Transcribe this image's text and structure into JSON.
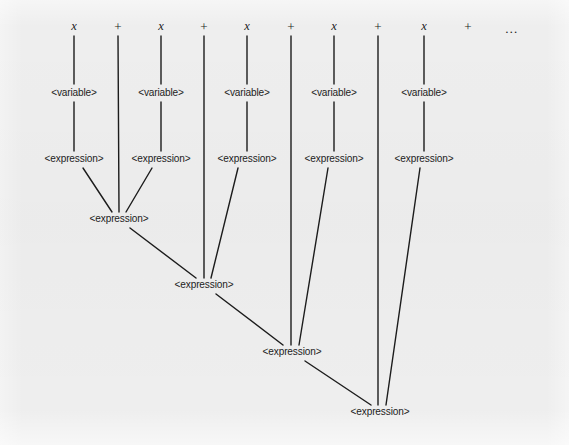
{
  "figure": {
    "kind": "parse-tree-diagram",
    "title": "",
    "canvas": {
      "width": 569,
      "height": 445
    },
    "background_color": "#eeeeee",
    "ink_color": "#1c1c1c",
    "line_width": 1.4
  },
  "labels": {
    "variable": "<variable>",
    "expression": "<expression>",
    "terminal_x": "x",
    "operator_plus": "+",
    "ellipsis": "…"
  },
  "input_string": {
    "tokens": [
      "x",
      "+",
      "x",
      "+",
      "x",
      "+",
      "x",
      "+",
      "x",
      "+",
      "…"
    ],
    "count": 11
  },
  "nodes": [
    {
      "id": "t1",
      "label": "x",
      "type": "terminal",
      "x": 74,
      "y": 26
    },
    {
      "id": "op1",
      "label": "+",
      "type": "operator",
      "x": 118,
      "y": 26
    },
    {
      "id": "t2",
      "label": "x",
      "type": "terminal",
      "x": 161,
      "y": 26
    },
    {
      "id": "op2",
      "label": "+",
      "type": "operator",
      "x": 204,
      "y": 26
    },
    {
      "id": "t3",
      "label": "x",
      "type": "terminal",
      "x": 247,
      "y": 26
    },
    {
      "id": "op3",
      "label": "+",
      "type": "operator",
      "x": 291,
      "y": 26
    },
    {
      "id": "t4",
      "label": "x",
      "type": "terminal",
      "x": 334,
      "y": 26
    },
    {
      "id": "op4",
      "label": "+",
      "type": "operator",
      "x": 378,
      "y": 26
    },
    {
      "id": "t5",
      "label": "x",
      "type": "terminal",
      "x": 424,
      "y": 26
    },
    {
      "id": "op5",
      "label": "+",
      "type": "operator",
      "x": 468,
      "y": 26
    },
    {
      "id": "ell",
      "label": "…",
      "type": "ellipsis",
      "x": 512,
      "y": 28
    },
    {
      "id": "v1",
      "label": "<variable>",
      "type": "nonterminal",
      "x": 74,
      "y": 93
    },
    {
      "id": "v2",
      "label": "<variable>",
      "type": "nonterminal",
      "x": 161,
      "y": 93
    },
    {
      "id": "v3",
      "label": "<variable>",
      "type": "nonterminal",
      "x": 247,
      "y": 93
    },
    {
      "id": "v4",
      "label": "<variable>",
      "type": "nonterminal",
      "x": 334,
      "y": 93
    },
    {
      "id": "v5",
      "label": "<variable>",
      "type": "nonterminal",
      "x": 424,
      "y": 93
    },
    {
      "id": "e1",
      "label": "<expression>",
      "type": "nonterminal",
      "x": 74,
      "y": 159
    },
    {
      "id": "e2",
      "label": "<expression>",
      "type": "nonterminal",
      "x": 161,
      "y": 159
    },
    {
      "id": "e3",
      "label": "<expression>",
      "type": "nonterminal",
      "x": 247,
      "y": 159
    },
    {
      "id": "e4",
      "label": "<expression>",
      "type": "nonterminal",
      "x": 334,
      "y": 159
    },
    {
      "id": "e5",
      "label": "<expression>",
      "type": "nonterminal",
      "x": 424,
      "y": 159
    },
    {
      "id": "E2",
      "label": "<expression>",
      "type": "nonterminal",
      "x": 119,
      "y": 219
    },
    {
      "id": "E3",
      "label": "<expression>",
      "type": "nonterminal",
      "x": 204,
      "y": 285
    },
    {
      "id": "E4",
      "label": "<expression>",
      "type": "nonterminal",
      "x": 292,
      "y": 352
    },
    {
      "id": "E5",
      "label": "<expression>",
      "type": "nonterminal",
      "x": 380,
      "y": 412
    }
  ],
  "edges": [
    {
      "from": "t1",
      "to": "v1",
      "x1": 74,
      "y1": 36,
      "x2": 74,
      "y2": 84
    },
    {
      "from": "t2",
      "to": "v2",
      "x1": 161,
      "y1": 36,
      "x2": 161,
      "y2": 84
    },
    {
      "from": "t3",
      "to": "v3",
      "x1": 247,
      "y1": 36,
      "x2": 247,
      "y2": 84
    },
    {
      "from": "t4",
      "to": "v4",
      "x1": 334,
      "y1": 36,
      "x2": 334,
      "y2": 84
    },
    {
      "from": "t5",
      "to": "v5",
      "x1": 424,
      "y1": 36,
      "x2": 424,
      "y2": 84
    },
    {
      "from": "v1",
      "to": "e1",
      "x1": 74,
      "y1": 102,
      "x2": 74,
      "y2": 151
    },
    {
      "from": "v2",
      "to": "e2",
      "x1": 161,
      "y1": 102,
      "x2": 161,
      "y2": 151
    },
    {
      "from": "v3",
      "to": "e3",
      "x1": 247,
      "y1": 102,
      "x2": 247,
      "y2": 151
    },
    {
      "from": "v4",
      "to": "e4",
      "x1": 334,
      "y1": 102,
      "x2": 334,
      "y2": 151
    },
    {
      "from": "v5",
      "to": "e5",
      "x1": 424,
      "y1": 102,
      "x2": 424,
      "y2": 151
    },
    {
      "from": "op1",
      "to": "E2",
      "x1": 118,
      "y1": 36,
      "x2": 119,
      "y2": 212
    },
    {
      "from": "e1",
      "to": "E2",
      "x1": 83,
      "y1": 168,
      "x2": 112,
      "y2": 212
    },
    {
      "from": "e2",
      "to": "E2",
      "x1": 152,
      "y1": 168,
      "x2": 126,
      "y2": 212
    },
    {
      "from": "op2",
      "to": "E3",
      "x1": 204,
      "y1": 36,
      "x2": 204,
      "y2": 278
    },
    {
      "from": "E2",
      "to": "E3",
      "x1": 130,
      "y1": 228,
      "x2": 196,
      "y2": 278
    },
    {
      "from": "e3",
      "to": "E3",
      "x1": 238,
      "y1": 168,
      "x2": 211,
      "y2": 278
    },
    {
      "from": "op3",
      "to": "E4",
      "x1": 291,
      "y1": 36,
      "x2": 291,
      "y2": 345
    },
    {
      "from": "E3",
      "to": "E4",
      "x1": 216,
      "y1": 294,
      "x2": 283,
      "y2": 345
    },
    {
      "from": "e4",
      "to": "E4",
      "x1": 328,
      "y1": 168,
      "x2": 299,
      "y2": 345
    },
    {
      "from": "op4",
      "to": "E5",
      "x1": 378,
      "y1": 36,
      "x2": 378,
      "y2": 405
    },
    {
      "from": "E4",
      "to": "E5",
      "x1": 305,
      "y1": 361,
      "x2": 371,
      "y2": 405
    },
    {
      "from": "e5",
      "to": "E5",
      "x1": 420,
      "y1": 168,
      "x2": 386,
      "y2": 405
    }
  ]
}
